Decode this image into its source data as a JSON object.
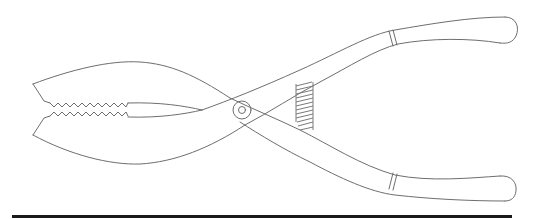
{
  "figure": {
    "subject": "pliers line drawing",
    "stroke_color": "#6e6e6e",
    "rule_color": "#1a1a1a",
    "background": "#ffffff",
    "parts": [
      "upper-jaw",
      "lower-jaw",
      "serrated-teeth",
      "pivot-rivet",
      "coil-spring",
      "upper-handle",
      "lower-handle",
      "upper-grip-band",
      "lower-grip-band"
    ]
  }
}
